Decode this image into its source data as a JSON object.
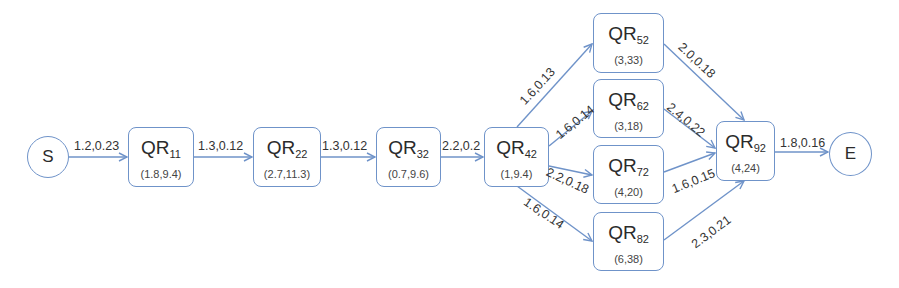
{
  "diagram": {
    "start": {
      "label": "S"
    },
    "end": {
      "label": "E"
    },
    "nodes": {
      "qr11": {
        "base": "QR",
        "sub": "11",
        "params": "(1.8,9.4)"
      },
      "qr22": {
        "base": "QR",
        "sub": "22",
        "params": "(2.7,11.3)"
      },
      "qr32": {
        "base": "QR",
        "sub": "32",
        "params": "(0.7,9.6)"
      },
      "qr42": {
        "base": "QR",
        "sub": "42",
        "params": "(1,9.4)"
      },
      "qr52": {
        "base": "QR",
        "sub": "52",
        "params": "(3,33)"
      },
      "qr62": {
        "base": "QR",
        "sub": "62",
        "params": "(3,18)"
      },
      "qr72": {
        "base": "QR",
        "sub": "72",
        "params": "(4,20)"
      },
      "qr82": {
        "base": "QR",
        "sub": "82",
        "params": "(6,38)"
      },
      "qr92": {
        "base": "QR",
        "sub": "92",
        "params": "(4,24)"
      }
    },
    "edges": {
      "s_qr11": "1.2,0.23",
      "qr11_qr22": "1.3,0.12",
      "qr22_qr32": "1.3,0.12",
      "qr32_qr42": "2.2,0.2",
      "qr42_qr52": "1.6,0.13",
      "qr42_qr62": "1.6,0.14",
      "qr42_qr72": "2.2,0.18",
      "qr42_qr82": "1.6,0.14",
      "qr52_qr92": "2.0,0.18",
      "qr62_qr92": "2.4,0.22",
      "qr72_qr92": "1.6,0.15",
      "qr82_qr92": "2.3,0.21",
      "qr92_e": "1.8,0.16"
    },
    "colors": {
      "stroke": "#6f93c9",
      "text": "#333333"
    }
  }
}
